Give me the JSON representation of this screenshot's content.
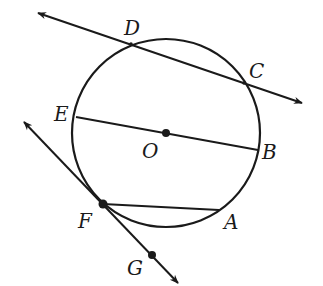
{
  "diagram": {
    "type": "circle-geometry",
    "stroke_color": "#1a1a1a",
    "background": "#ffffff",
    "circle": {
      "center_label": "O",
      "cx": 166,
      "cy": 133,
      "r": 94
    },
    "points": [
      {
        "label": "D",
        "x": 131,
        "y": 44
      },
      {
        "label": "C",
        "x": 244,
        "y": 83
      },
      {
        "label": "E",
        "x": 76,
        "y": 117
      },
      {
        "label": "O",
        "x": 166,
        "y": 133
      },
      {
        "label": "B",
        "x": 258,
        "y": 150
      },
      {
        "label": "F",
        "x": 103,
        "y": 204
      },
      {
        "label": "A",
        "x": 219,
        "y": 210
      },
      {
        "label": "G",
        "x": 152,
        "y": 255
      }
    ],
    "lines": [
      {
        "name": "secant-DC",
        "kind": "line",
        "through": [
          "D",
          "C"
        ]
      },
      {
        "name": "tangent-FG",
        "kind": "line",
        "through": [
          "F",
          "G"
        ]
      }
    ],
    "segments": [
      {
        "name": "diameter-EB",
        "from": "E",
        "to": "B"
      },
      {
        "name": "chord-FA",
        "from": "F",
        "to": "A"
      }
    ],
    "labels": {
      "D": "D",
      "C": "C",
      "E": "E",
      "O": "O",
      "B": "B",
      "F": "F",
      "A": "A",
      "G": "G"
    }
  }
}
